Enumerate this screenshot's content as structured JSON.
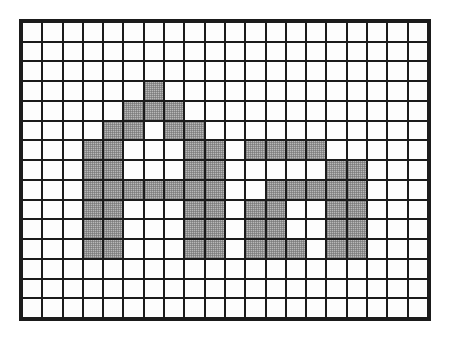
{
  "figure": {
    "title": "",
    "kind": "pixel-grid-worksheet",
    "grid": {
      "columns": 20,
      "rows": 15,
      "cell_fill_empty": "#fdfdfd",
      "cell_fill_shaded": "#b8b8b8",
      "line_color": "#1b1b1b",
      "background": "#ffffff"
    },
    "legend": {
      "shaded_label": "shaded square",
      "empty_label": "empty square"
    },
    "shaded_cells_by_row": [
      [],
      [],
      [],
      [
        6
      ],
      [
        5,
        6,
        7
      ],
      [
        4,
        5,
        7,
        8
      ],
      [
        3,
        4,
        8,
        9,
        11,
        12,
        13,
        14
      ],
      [
        3,
        4,
        8,
        9,
        15,
        16
      ],
      [
        3,
        4,
        5,
        6,
        7,
        8,
        9,
        12,
        13,
        14,
        15,
        16
      ],
      [
        3,
        4,
        8,
        9,
        11,
        12,
        15,
        16
      ],
      [
        3,
        4,
        8,
        9,
        11,
        12,
        15,
        16
      ],
      [
        3,
        4,
        8,
        9,
        11,
        12,
        13,
        15,
        16
      ],
      [],
      [],
      []
    ],
    "shaded_count": 55,
    "total_cells": 300
  },
  "chart_data": {
    "type": "heatmap",
    "title": "",
    "xlabel": "",
    "ylabel": "",
    "columns": 20,
    "rows": 15,
    "values": [
      [
        0,
        0,
        0,
        0,
        0,
        0,
        0,
        0,
        0,
        0,
        0,
        0,
        0,
        0,
        0,
        0,
        0,
        0,
        0,
        0
      ],
      [
        0,
        0,
        0,
        0,
        0,
        0,
        0,
        0,
        0,
        0,
        0,
        0,
        0,
        0,
        0,
        0,
        0,
        0,
        0,
        0
      ],
      [
        0,
        0,
        0,
        0,
        0,
        0,
        0,
        0,
        0,
        0,
        0,
        0,
        0,
        0,
        0,
        0,
        0,
        0,
        0,
        0
      ],
      [
        0,
        0,
        0,
        0,
        0,
        0,
        1,
        0,
        0,
        0,
        0,
        0,
        0,
        0,
        0,
        0,
        0,
        0,
        0,
        0
      ],
      [
        0,
        0,
        0,
        0,
        0,
        1,
        1,
        1,
        0,
        0,
        0,
        0,
        0,
        0,
        0,
        0,
        0,
        0,
        0,
        0
      ],
      [
        0,
        0,
        0,
        0,
        1,
        1,
        0,
        1,
        1,
        0,
        0,
        0,
        0,
        0,
        0,
        0,
        0,
        0,
        0,
        0
      ],
      [
        0,
        0,
        0,
        1,
        1,
        0,
        0,
        0,
        1,
        1,
        0,
        1,
        1,
        1,
        1,
        0,
        0,
        0,
        0,
        0
      ],
      [
        0,
        0,
        0,
        1,
        1,
        0,
        0,
        0,
        1,
        1,
        0,
        0,
        0,
        0,
        0,
        1,
        1,
        0,
        0,
        0
      ],
      [
        0,
        0,
        0,
        1,
        1,
        1,
        1,
        1,
        1,
        1,
        0,
        0,
        1,
        1,
        1,
        1,
        1,
        0,
        0,
        0
      ],
      [
        0,
        0,
        0,
        1,
        1,
        0,
        0,
        0,
        1,
        1,
        0,
        1,
        1,
        0,
        0,
        1,
        1,
        0,
        0,
        0
      ],
      [
        0,
        0,
        0,
        1,
        1,
        0,
        0,
        0,
        1,
        1,
        0,
        1,
        1,
        0,
        0,
        1,
        1,
        0,
        0,
        0
      ],
      [
        0,
        0,
        0,
        1,
        1,
        0,
        0,
        0,
        1,
        1,
        0,
        1,
        1,
        1,
        0,
        1,
        1,
        0,
        0,
        0
      ],
      [
        0,
        0,
        0,
        0,
        0,
        0,
        0,
        0,
        0,
        0,
        0,
        0,
        0,
        0,
        0,
        0,
        0,
        0,
        0,
        0
      ],
      [
        0,
        0,
        0,
        0,
        0,
        0,
        0,
        0,
        0,
        0,
        0,
        0,
        0,
        0,
        0,
        0,
        0,
        0,
        0,
        0
      ],
      [
        0,
        0,
        0,
        0,
        0,
        0,
        0,
        0,
        0,
        0,
        0,
        0,
        0,
        0,
        0,
        0,
        0,
        0,
        0,
        0
      ]
    ],
    "colorscale": [
      "#fdfdfd",
      "#b8b8b8"
    ],
    "grid": true,
    "legend_position": "none"
  }
}
